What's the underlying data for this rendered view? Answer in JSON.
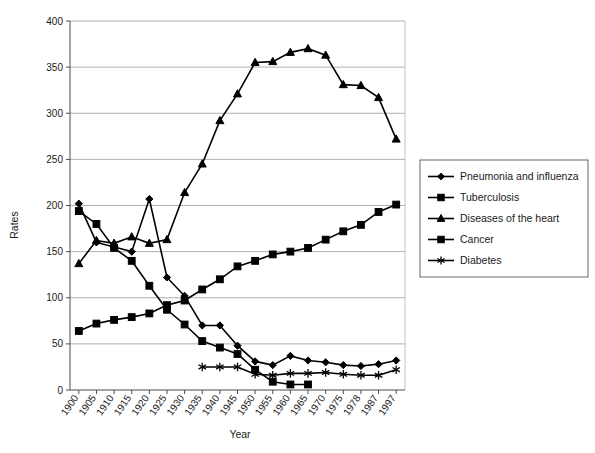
{
  "chart_data": {
    "type": "line",
    "title": "",
    "xlabel": "Year",
    "ylabel": "Rates",
    "ylim": [
      0,
      400
    ],
    "ytick_step": 50,
    "yticks": [
      0,
      50,
      100,
      150,
      200,
      250,
      300,
      350,
      400
    ],
    "grid": true,
    "legend_position": "right",
    "categories": [
      "1900",
      "1905",
      "1910",
      "1915",
      "1920",
      "1925",
      "1930",
      "1935",
      "1940",
      "1945",
      "1950",
      "1955",
      "1960",
      "1965",
      "1970",
      "1975",
      "1978",
      "1987",
      "1997"
    ],
    "series": [
      {
        "name": "Pneumonia and influenza",
        "marker": "diamond",
        "values": [
          202,
          160,
          155,
          150,
          207,
          122,
          102,
          70,
          70,
          48,
          31,
          27,
          37,
          32,
          30,
          27,
          26,
          28,
          32
        ]
      },
      {
        "name": "Tuberculosis",
        "marker": "square",
        "values": [
          194,
          180,
          154,
          140,
          113,
          87,
          71,
          53,
          46,
          39,
          22,
          9,
          6,
          6,
          null,
          null,
          null,
          null,
          null
        ]
      },
      {
        "name": "Diseases of the heart",
        "marker": "triangle",
        "values": [
          137,
          162,
          159,
          166,
          159,
          163,
          214,
          245,
          292,
          321,
          355,
          356,
          366,
          370,
          363,
          331,
          330,
          317,
          272
        ]
      },
      {
        "name": "Cancer",
        "marker": "square",
        "values": [
          64,
          72,
          76,
          79,
          83,
          92,
          97,
          109,
          120,
          134,
          140,
          147,
          150,
          154,
          163,
          172,
          179,
          193,
          201
        ]
      },
      {
        "name": "Diabetes",
        "marker": "star",
        "values": [
          null,
          null,
          null,
          null,
          null,
          null,
          null,
          25,
          25,
          25,
          17,
          16,
          18,
          18,
          19,
          17,
          16,
          16,
          22
        ]
      }
    ],
    "legend_entries": [
      {
        "label": "Pneumonia and influenza",
        "marker": "diamond"
      },
      {
        "label": "Tuberculosis",
        "marker": "square"
      },
      {
        "label": "Diseases of the heart",
        "marker": "triangle"
      },
      {
        "label": "Cancer",
        "marker": "square"
      },
      {
        "label": "Diabetes",
        "marker": "star"
      }
    ],
    "colors": {
      "series": "#000000",
      "grid": "#9a9a9a",
      "axis": "#4d4d4d",
      "background": "#ffffff"
    }
  }
}
